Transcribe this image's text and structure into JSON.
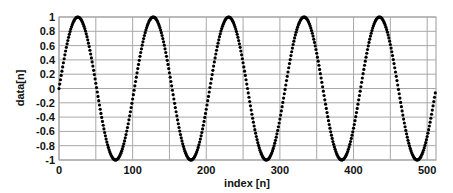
{
  "chart_data": {
    "type": "scatter",
    "title": "",
    "xlabel": "index [n]",
    "ylabel": "data[n]",
    "xlim": [
      0,
      512
    ],
    "ylim": [
      -1,
      1
    ],
    "xticks": [
      0,
      100,
      200,
      300,
      400,
      500
    ],
    "xgrid": [
      0,
      50,
      100,
      150,
      200,
      250,
      300,
      350,
      400,
      450,
      500
    ],
    "yticks": [
      1,
      0.8,
      0.6,
      0.4,
      0.2,
      0,
      -0.2,
      -0.4,
      -0.6,
      -0.8,
      -1
    ],
    "ytick_labels": [
      "1",
      "0.8",
      "0.6",
      "0.4",
      "0.2",
      "0",
      "-0.2",
      "-0.4",
      "-0.6",
      "-0.8",
      "-1"
    ],
    "grid": true,
    "legend": null,
    "series": [
      {
        "name": "data[n]",
        "formula": "sin(2*pi*5*n/512)",
        "n_points": 512,
        "cycles": 5,
        "marker": "dot",
        "color": "#000000"
      }
    ]
  }
}
